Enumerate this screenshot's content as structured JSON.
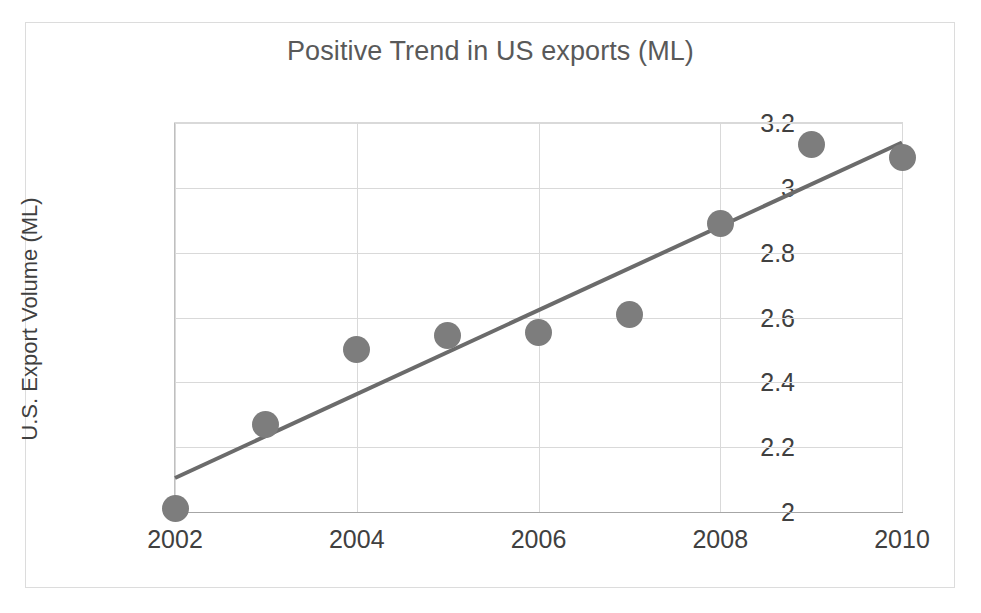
{
  "chart_data": {
    "type": "scatter",
    "title": "Positive Trend in US exports (ML)",
    "xlabel": "",
    "ylabel": "U.S. Export Volume (ML)",
    "x": [
      2002,
      2003,
      2004,
      2005,
      2006,
      2007,
      2008,
      2009,
      2010
    ],
    "values": [
      2.01,
      2.27,
      2.5,
      2.545,
      2.555,
      2.61,
      2.89,
      3.135,
      3.095
    ],
    "series": [
      {
        "name": "U.S. Export Volume (ML)",
        "values": [
          2.01,
          2.27,
          2.5,
          2.545,
          2.555,
          2.61,
          2.89,
          3.135,
          3.095
        ],
        "marker_color": "#7d7d7d"
      }
    ],
    "trendline": {
      "type": "linear",
      "x_start": 2002,
      "y_start": 2.105,
      "x_end": 2010,
      "y_end": 3.14,
      "color": "#6b6b6b",
      "width_px": 4
    },
    "xlim": [
      2002,
      2010
    ],
    "ylim": [
      2,
      3.2
    ],
    "xticks": [
      2002,
      2004,
      2006,
      2008,
      2010
    ],
    "xtick_labels": [
      "2002",
      "2004",
      "2006",
      "2008",
      "2010"
    ],
    "yticks": [
      2,
      2.2,
      2.4,
      2.6,
      2.8,
      3,
      3.2
    ],
    "ytick_labels": [
      "2",
      "2.2",
      "2.4",
      "2.6",
      "2.8",
      "3",
      "3.2"
    ],
    "grid": {
      "horizontal": true,
      "vertical": true,
      "color": "#d9d9d9"
    },
    "legend": {
      "visible": false,
      "position": "none"
    },
    "colors": {
      "marker": "#7d7d7d",
      "trendline": "#6b6b6b",
      "gridline": "#d9d9d9",
      "axis": "#a6a6a6",
      "title_text": "#595959",
      "tick_text": "#404040",
      "frame": "#dcdcdc",
      "background": "#ffffff"
    }
  }
}
